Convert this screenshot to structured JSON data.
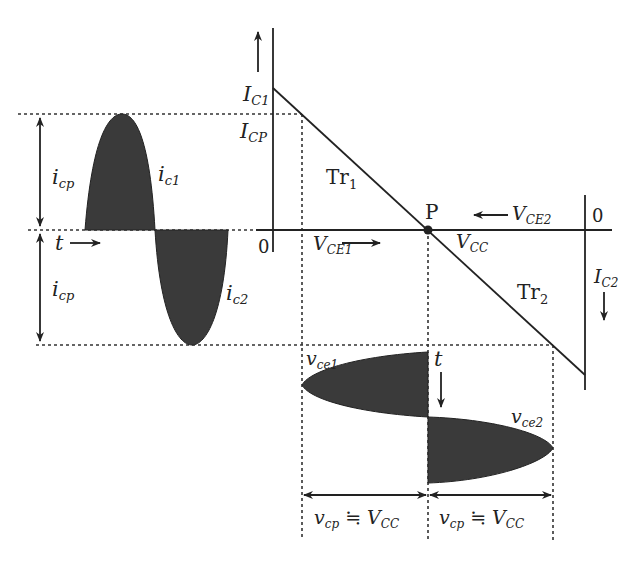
{
  "diagram": {
    "type": "class-B push-pull load line diagram",
    "colors": {
      "ink": "#222222",
      "fill": "#3a3a3a",
      "background": "#ffffff"
    },
    "labels": {
      "ic1_axis": "I",
      "ic1_axis_sub": "C1",
      "icp_axis": "I",
      "icp_axis_sub": "CP",
      "origin_left": "0",
      "origin_right": "0",
      "tr1": "Tr",
      "tr1_sub": "1",
      "tr2": "Tr",
      "tr2_sub": "2",
      "point_p": "P",
      "vce1": "V",
      "vce1_sub": "CE1",
      "vce2": "V",
      "vce2_sub": "CE2",
      "vcc": "V",
      "vcc_sub": "CC",
      "ic2_axis": "I",
      "ic2_axis_sub": "C2",
      "icp_top": "i",
      "icp_top_sub": "cp",
      "icp_bottom": "i",
      "icp_bottom_sub": "cp",
      "t_horizontal": "t",
      "t_vertical": "t",
      "ic1_wave": "i",
      "ic1_wave_sub": "c1",
      "ic2_wave": "i",
      "ic2_wave_sub": "c2",
      "vce1_wave": "v",
      "vce1_wave_sub": "ce1",
      "vce2_wave": "v",
      "vce2_wave_sub": "ce2",
      "vcp_left": "v",
      "vcp_left_sub": "cp",
      "vcp_left_rel": "≒",
      "vcp_left_rhs": "V",
      "vcp_left_rhs_sub": "CC",
      "vcp_right": "v",
      "vcp_right_sub": "cp",
      "vcp_right_rel": "≒",
      "vcp_right_rhs": "V",
      "vcp_right_rhs_sub": "CC"
    }
  }
}
